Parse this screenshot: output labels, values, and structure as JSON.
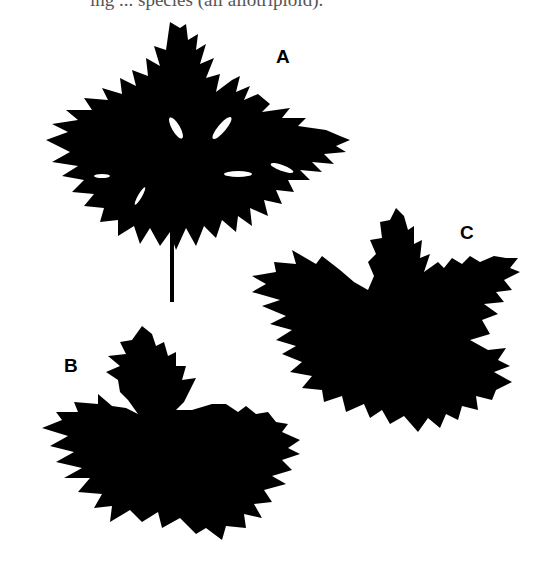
{
  "figure": {
    "caption_fragment": "ing ... species (all allotriploid).",
    "panels": [
      {
        "label": "A",
        "description": "deeply dissected palmate leaf with petiole"
      },
      {
        "label": "B",
        "description": "palmately lobed leaf, broad lobes"
      },
      {
        "label": "C",
        "description": "palmately lobed leaf, toothed lobes"
      }
    ],
    "colors": {
      "silhouette": "#000000",
      "background": "#ffffff"
    }
  }
}
